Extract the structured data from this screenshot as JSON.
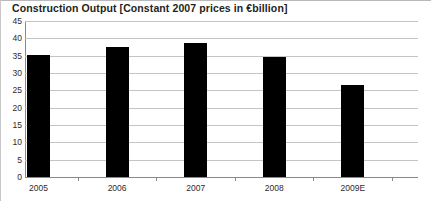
{
  "chart_data": {
    "type": "bar",
    "title": "Construction Output [Constant 2007 prices in €billion]",
    "xlabel": "",
    "ylabel": "",
    "categories": [
      "2005",
      "2006",
      "2007",
      "2008",
      "2009E"
    ],
    "values": [
      35.2,
      37.5,
      38.8,
      34.5,
      26.5
    ],
    "series": [
      {
        "name": "Construction Output",
        "values": [
          35.2,
          37.5,
          38.8,
          34.5,
          26.5
        ],
        "color": "#000000"
      }
    ],
    "ylim": [
      0,
      45
    ],
    "yticks": [
      0,
      5,
      10,
      15,
      20,
      25,
      30,
      35,
      40,
      45
    ],
    "ytick_labels": [
      "0",
      "5",
      "10",
      "15",
      "20",
      "25",
      "30",
      "35",
      "40",
      "45"
    ],
    "grid": true,
    "legend": false,
    "legend_position": "none",
    "units": "€ billion (constant 2007 prices)"
  },
  "colors": {
    "bar": "#000000",
    "gridline": "#c4c4c4",
    "axis": "#8a8a8a",
    "text": "#231f20",
    "background": "#ffffff"
  }
}
